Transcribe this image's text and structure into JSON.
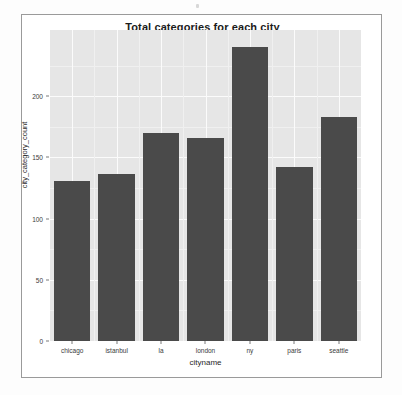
{
  "chart_data": {
    "type": "bar",
    "title": "Total categories for each city",
    "xlabel": "cityname",
    "ylabel": "city_category_count",
    "categories": [
      "chicago",
      "istanbul",
      "la",
      "london",
      "ny",
      "paris",
      "seattle"
    ],
    "values": [
      131,
      136,
      170,
      166,
      240,
      142,
      183
    ],
    "yticks": [
      0,
      50,
      100,
      150,
      200
    ],
    "ytick_labels": [
      "0",
      "50",
      "100",
      "150",
      "200"
    ],
    "ylim": [
      0,
      254
    ],
    "grid": true,
    "legend": "none",
    "bar_color": "#4a4a4a",
    "panel_color": "#e6e6e6",
    "grid_color": "#fbfbfb"
  },
  "figure": {
    "border_color": "#9a9a9a",
    "background": "#ffffff"
  }
}
